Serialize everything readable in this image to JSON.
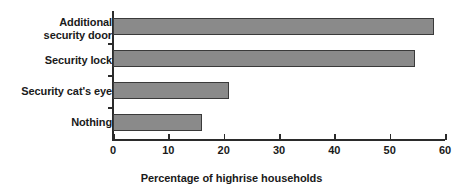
{
  "chart_data": {
    "type": "bar",
    "orientation": "horizontal",
    "title": "",
    "xlabel": "Percentage of highrise households",
    "ylabel": "",
    "categories": [
      "Additional\nsecurity door",
      "Security lock",
      "Security cat's eye",
      "Nothing"
    ],
    "values": [
      58,
      54.5,
      21,
      16
    ],
    "xlim": [
      0,
      60
    ],
    "xticks": [
      0,
      10,
      20,
      30,
      40,
      50,
      60
    ],
    "xtick_labels": [
      "0",
      "10",
      "20",
      "30",
      "40",
      "50",
      "60"
    ],
    "grid": false,
    "legend": null,
    "series": [
      {
        "name": "Percentage of highrise households",
        "values": [
          58,
          54.5,
          21,
          16
        ]
      }
    ],
    "colors": {
      "bar_fill": "#8a8a8a",
      "bar_border": "#3a3a3a",
      "axis": "#2b2b2b",
      "text": "#1a1a1a",
      "background": "#ffffff"
    }
  }
}
